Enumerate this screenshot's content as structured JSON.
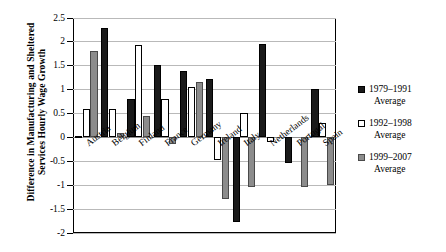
{
  "chart_data": {
    "type": "bar",
    "title": "",
    "xlabel": "",
    "ylabel": "Difference in Manufacturing and Sheltered Services Hourly Wage Growth",
    "ylim": [
      -2,
      2.5
    ],
    "ytick_step": 0.5,
    "yticks": [
      "2.5",
      "2",
      "1.5",
      "1",
      "0.5",
      "0",
      "-0.5",
      "-1",
      "-1.5",
      "-2"
    ],
    "ytick_values": [
      2.5,
      2,
      1.5,
      1,
      0.5,
      0,
      -0.5,
      -1,
      -1.5,
      -2
    ],
    "grid": true,
    "legend_position": "right",
    "categories": [
      "Austria",
      "Belgium",
      "Finland",
      "France",
      "Germany",
      "Ireland",
      "Italy",
      "Netherlands",
      "Portugal",
      "Spain"
    ],
    "series": [
      {
        "name": "1979–1991 Average",
        "color": "#1a1a1a",
        "values": [
          0.02,
          2.28,
          0.8,
          1.5,
          1.38,
          1.22,
          -1.78,
          1.95,
          -0.55,
          1.0
        ]
      },
      {
        "name": "1992–1998 Average",
        "color": "#ffffff",
        "values": [
          0.58,
          0.58,
          1.93,
          0.8,
          1.05,
          -0.48,
          0.5,
          -0.1,
          0.0,
          0.3
        ]
      },
      {
        "name": "1999–2007 Average",
        "color": "#8c8c8c",
        "values": [
          1.8,
          0.08,
          0.43,
          -0.15,
          1.15,
          -1.3,
          -1.05,
          0.0,
          -1.05,
          -1.0
        ]
      }
    ]
  },
  "legend": {
    "items": [
      {
        "label_line1": "1979–1991",
        "label_line2": "Average"
      },
      {
        "label_line1": "1992–1998",
        "label_line2": "Average"
      },
      {
        "label_line1": "1999–2007",
        "label_line2": "Average"
      }
    ]
  }
}
